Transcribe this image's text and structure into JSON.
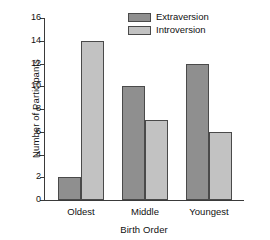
{
  "chart_data": {
    "type": "bar",
    "title": "",
    "xlabel": "Birth Order",
    "ylabel": "Number of Participants",
    "categories": [
      "Oldest",
      "Middle",
      "Youngest"
    ],
    "series": [
      {
        "name": "Extraversion",
        "values": [
          2,
          10,
          12
        ],
        "color": "#8f8f8f"
      },
      {
        "name": "Introversion",
        "values": [
          14,
          7,
          6
        ],
        "color": "#c2c2c2"
      }
    ],
    "ylim": [
      0,
      16
    ],
    "ytick_labels": [
      "0",
      "2",
      "4",
      "6",
      "8",
      "10",
      "12",
      "14",
      "16"
    ],
    "ytick_values": [
      0,
      2,
      4,
      6,
      8,
      10,
      12,
      14,
      16
    ],
    "grid": false,
    "legend_position": "top-center"
  },
  "legend": {
    "entries": [
      {
        "label": "Extraversion"
      },
      {
        "label": "Introversion"
      }
    ]
  }
}
